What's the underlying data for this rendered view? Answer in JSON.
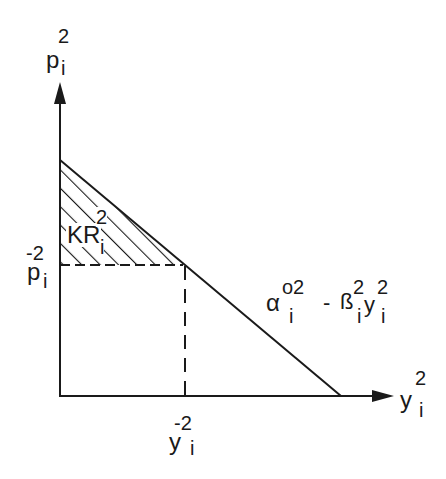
{
  "diagram": {
    "y_axis": {
      "base": "p",
      "sup": "2",
      "sub": "i"
    },
    "x_axis": {
      "base": "y",
      "sup": "2",
      "sub": "i"
    },
    "p_bar": {
      "base": "p",
      "sup": "-2",
      "sub": "i"
    },
    "y_bar": {
      "base": "y",
      "sup": "-2",
      "sub": "i"
    },
    "area_label": {
      "base": "KR",
      "sup": "2",
      "sub": "i"
    },
    "line_label": {
      "alpha": "α",
      "alpha_sup": "o2",
      "alpha_sub": "i",
      "minus": "-",
      "beta": "ß",
      "beta_sup": "2",
      "beta_sub": "i",
      "y": "y",
      "y_sup": "2",
      "y_sub": "i"
    },
    "colors": {
      "ink": "#1a1a1a",
      "background": "#ffffff"
    }
  }
}
